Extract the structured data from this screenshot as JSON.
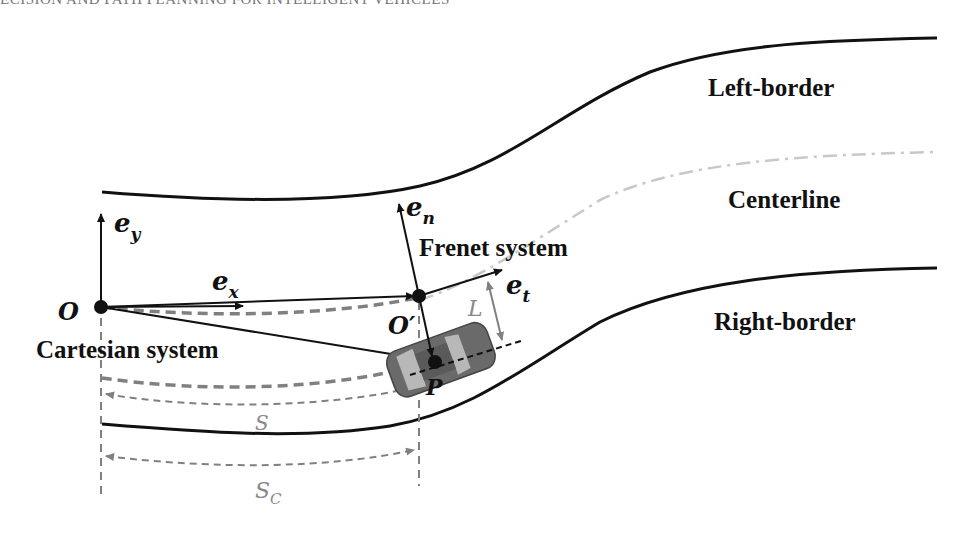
{
  "running_head": "ECISION AND PATH PLANNING FOR INTELLIGENT VEHICLES",
  "labels": {
    "left_border": "Left-border",
    "centerline": "Centerline",
    "right_border": "Right-border",
    "frenet_system": "Frenet system",
    "cartesian_system": "Cartesian system"
  },
  "symbols": {
    "origin": "O",
    "origin_prime": "O′",
    "point": "P",
    "e_x": "e",
    "e_x_sub": "x",
    "e_y": "e",
    "e_y_sub": "y",
    "e_n": "e",
    "e_n_sub": "n",
    "e_t": "e",
    "e_t_sub": "t",
    "lateral_offset": "L",
    "arc_s": "S",
    "arc_sc": "S",
    "arc_sc_sub": "C"
  },
  "colors": {
    "road_border": "#111111",
    "centerline": "#c8c8c8",
    "dim_gray": "#808080",
    "vehicle_body": "#6a6a6a",
    "vehicle_window": "#b8b8b8"
  }
}
